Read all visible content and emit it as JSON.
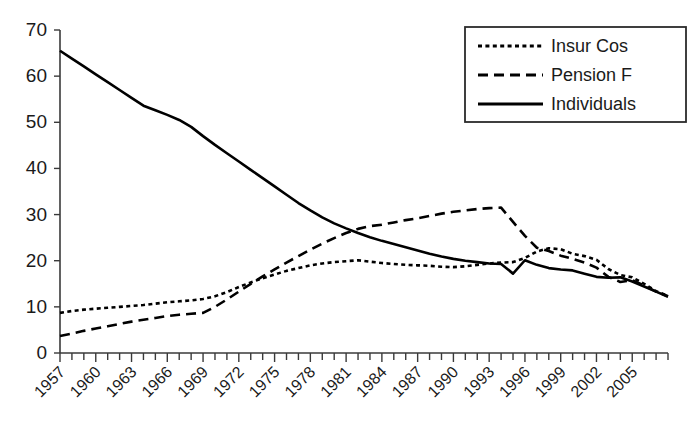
{
  "chart_data": {
    "type": "line",
    "title": "",
    "subtitle": "",
    "xlabel": "",
    "ylabel": "",
    "xlim": [
      1957,
      2008
    ],
    "ylim": [
      0,
      70
    ],
    "grid": false,
    "legend_position": "top-right",
    "y_ticks": [
      0,
      10,
      20,
      30,
      40,
      50,
      60,
      70
    ],
    "y_tick_labels": [
      "0",
      "10",
      "20",
      "30",
      "40",
      "50",
      "60",
      "70"
    ],
    "x_tick_labels": [
      "1957",
      "1960",
      "1963",
      "1966",
      "1969",
      "1972",
      "1975",
      "1978",
      "1981",
      "1984",
      "1987",
      "1990",
      "1993",
      "1996",
      "1999",
      "2002",
      "2005"
    ],
    "x_tick_label_years": [
      1957,
      1960,
      1963,
      1966,
      1969,
      1972,
      1975,
      1978,
      1981,
      1984,
      1987,
      1990,
      1993,
      1996,
      1999,
      2002,
      2005
    ],
    "x_minor_tick_years": [
      1957,
      1958,
      1959,
      1960,
      1961,
      1962,
      1963,
      1964,
      1965,
      1966,
      1967,
      1968,
      1969,
      1970,
      1971,
      1972,
      1973,
      1974,
      1975,
      1976,
      1977,
      1978,
      1979,
      1980,
      1981,
      1982,
      1983,
      1984,
      1985,
      1986,
      1987,
      1988,
      1989,
      1990,
      1991,
      1992,
      1993,
      1994,
      1995,
      1996,
      1997,
      1998,
      1999,
      2000,
      2001,
      2002,
      2003,
      2004,
      2005,
      2006,
      2007,
      2008
    ],
    "x": [
      1957,
      1958,
      1959,
      1960,
      1961,
      1962,
      1963,
      1964,
      1965,
      1966,
      1967,
      1968,
      1969,
      1970,
      1971,
      1972,
      1973,
      1974,
      1975,
      1976,
      1977,
      1978,
      1979,
      1980,
      1981,
      1982,
      1983,
      1984,
      1985,
      1986,
      1987,
      1988,
      1989,
      1990,
      1991,
      1992,
      1993,
      1994,
      1995,
      1996,
      1997,
      1998,
      1999,
      2000,
      2001,
      2002,
      2003,
      2004,
      2005,
      2006,
      2007,
      2008
    ],
    "series": [
      {
        "name": "Insur Cos",
        "dash": "dotted",
        "values": [
          8.7,
          9.1,
          9.4,
          9.6,
          9.8,
          10.0,
          10.2,
          10.4,
          10.7,
          11.0,
          11.2,
          11.4,
          11.7,
          12.3,
          13.2,
          14.3,
          15.3,
          16.2,
          17.0,
          17.8,
          18.4,
          19.0,
          19.4,
          19.7,
          19.9,
          20.1,
          19.8,
          19.5,
          19.3,
          19.1,
          19.0,
          18.9,
          18.7,
          18.6,
          18.8,
          19.1,
          19.4,
          19.6,
          19.7,
          20.6,
          22.0,
          22.7,
          22.5,
          21.5,
          21.0,
          20.2,
          18.2,
          16.9,
          16.4,
          15.0,
          13.4,
          12.4
        ]
      },
      {
        "name": "Pension F",
        "dash": "dashed",
        "values": [
          3.7,
          4.2,
          4.8,
          5.3,
          5.8,
          6.3,
          6.8,
          7.2,
          7.6,
          8.0,
          8.3,
          8.5,
          8.7,
          10.0,
          11.6,
          13.3,
          15.0,
          16.6,
          18.1,
          19.6,
          21.0,
          22.4,
          23.7,
          24.9,
          26.0,
          26.9,
          27.5,
          27.8,
          28.3,
          28.8,
          29.2,
          29.7,
          30.2,
          30.6,
          30.9,
          31.2,
          31.4,
          31.5,
          28.4,
          25.4,
          22.8,
          22.1,
          21.1,
          20.4,
          19.6,
          18.5,
          16.5,
          15.4,
          15.8,
          14.6,
          13.3,
          12.3
        ]
      },
      {
        "name": "Individuals",
        "dash": "solid",
        "values": [
          65.5,
          63.8,
          62.1,
          60.4,
          58.7,
          57.0,
          55.3,
          53.6,
          52.6,
          51.6,
          50.5,
          49.0,
          47.0,
          45.1,
          43.3,
          41.5,
          39.7,
          37.9,
          36.1,
          34.3,
          32.5,
          30.9,
          29.4,
          28.1,
          27.0,
          26.0,
          25.1,
          24.3,
          23.6,
          22.9,
          22.2,
          21.5,
          20.9,
          20.4,
          20.0,
          19.7,
          19.4,
          19.3,
          17.2,
          20.1,
          19.1,
          18.4,
          18.1,
          17.9,
          17.2,
          16.5,
          16.3,
          16.4,
          15.5,
          14.4,
          13.3,
          12.2
        ]
      }
    ]
  },
  "legend": {
    "items": [
      {
        "label": "Insur Cos",
        "style": "dotted"
      },
      {
        "label": "Pension F",
        "style": "dashed"
      },
      {
        "label": "Individuals",
        "style": "solid"
      }
    ]
  },
  "colors": {
    "line": "#000000",
    "axis": "#3a3a3a",
    "text": "#1a1a1a",
    "background": "#ffffff"
  }
}
